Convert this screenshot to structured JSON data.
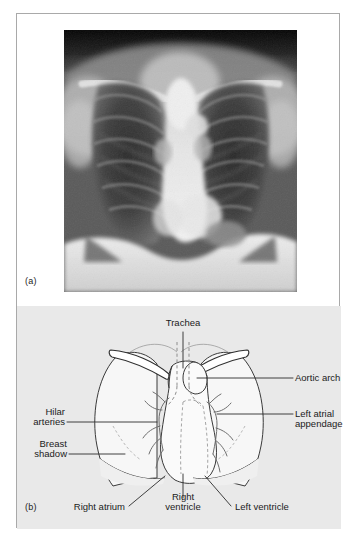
{
  "figure": {
    "panels": [
      {
        "id": "a",
        "label": "(a)",
        "kind": "radiograph",
        "description": "Frontal chest radiograph (PA chest X-ray)"
      },
      {
        "id": "b",
        "label": "(b)",
        "kind": "line-diagram",
        "description": "Line diagram of the chest radiograph with labelled structures"
      }
    ]
  },
  "colors": {
    "page_background": "#ffffff",
    "frame_border": "#a9a9a9",
    "diagram_background": "#e9e9e9",
    "outline": "#3a3a3a",
    "dashed_outline": "#8d8d8d",
    "label_text": "#1b1b1b",
    "leader_line": "#2b2b2b"
  },
  "diagram_labels": {
    "trachea": "Trachea",
    "aortic_arch": "Aortic arch",
    "left_atrial_appendage_line1": "Left atrial",
    "left_atrial_appendage_line2": "appendage",
    "hilar_arteries_line1": "Hilar",
    "hilar_arteries_line2": "arteries",
    "breast_shadow_line1": "Breast",
    "breast_shadow_line2": "shadow",
    "right_atrium": "Right atrium",
    "right_ventricle_line1": "Right",
    "right_ventricle_line2": "ventricle",
    "left_ventricle": "Left ventricle"
  }
}
